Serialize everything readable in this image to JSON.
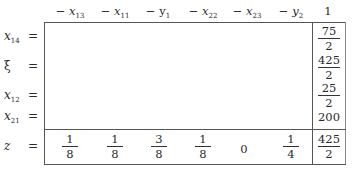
{
  "tableau": {
    "columns": [
      {
        "sign": "−",
        "var": "x",
        "sub": "13"
      },
      {
        "sign": "−",
        "var": "x",
        "sub": "11"
      },
      {
        "sign": "−",
        "var": "y",
        "sub": "1"
      },
      {
        "sign": "−",
        "var": "x",
        "sub": "22"
      },
      {
        "sign": "−",
        "var": "x",
        "sub": "23"
      },
      {
        "sign": "−",
        "var": "y",
        "sub": "2"
      }
    ],
    "rhs_header": "1",
    "rows": [
      {
        "var": "x",
        "sub": "14",
        "eq": "=",
        "rhs": {
          "num": "75",
          "den": "2"
        }
      },
      {
        "var": "ξ",
        "sub": "",
        "eq": "=",
        "rhs": {
          "num": "425",
          "den": "2"
        }
      },
      {
        "var": "x",
        "sub": "12",
        "eq": "=",
        "rhs": {
          "num": "25",
          "den": "2"
        }
      },
      {
        "var": "x",
        "sub": "21",
        "eq": "=",
        "rhs": {
          "value": "200"
        }
      }
    ],
    "objective": {
      "var": "z",
      "eq": "=",
      "coefficients": [
        {
          "num": "1",
          "den": "8"
        },
        {
          "num": "1",
          "den": "8"
        },
        {
          "num": "3",
          "den": "8"
        },
        {
          "num": "1",
          "den": "8"
        },
        {
          "value": "0"
        },
        {
          "num": "1",
          "den": "4"
        }
      ],
      "rhs": {
        "num": "425",
        "den": "2"
      }
    }
  }
}
